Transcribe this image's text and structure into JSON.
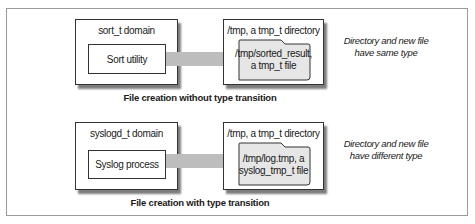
{
  "panels": [
    {
      "domain_label": "sort_t domain",
      "process_label": "Sort utility",
      "directory_label": "/tmp, a tmp_t directory",
      "file_line1": "/tmp/sorted_result,",
      "file_line2": "a tmp_t file",
      "note_line1": "Directory and new file",
      "note_line2": "have same type",
      "caption": "File creation without type transition"
    },
    {
      "domain_label": "syslogd_t domain",
      "process_label": "Syslog process",
      "directory_label": "/tmp, a tmp_t directory",
      "file_line1": "/tmp/log.tmp, a",
      "file_line2": "syslog_tmp_t file",
      "note_line1": "Directory and new file",
      "note_line2": "have different type",
      "caption": "File creation with type transition"
    }
  ],
  "colors": {
    "arrow_fill": "#bdbdbd",
    "folder_fill": "#e6e6e6",
    "border": "#333333",
    "shadow": "#7d7d7d"
  }
}
